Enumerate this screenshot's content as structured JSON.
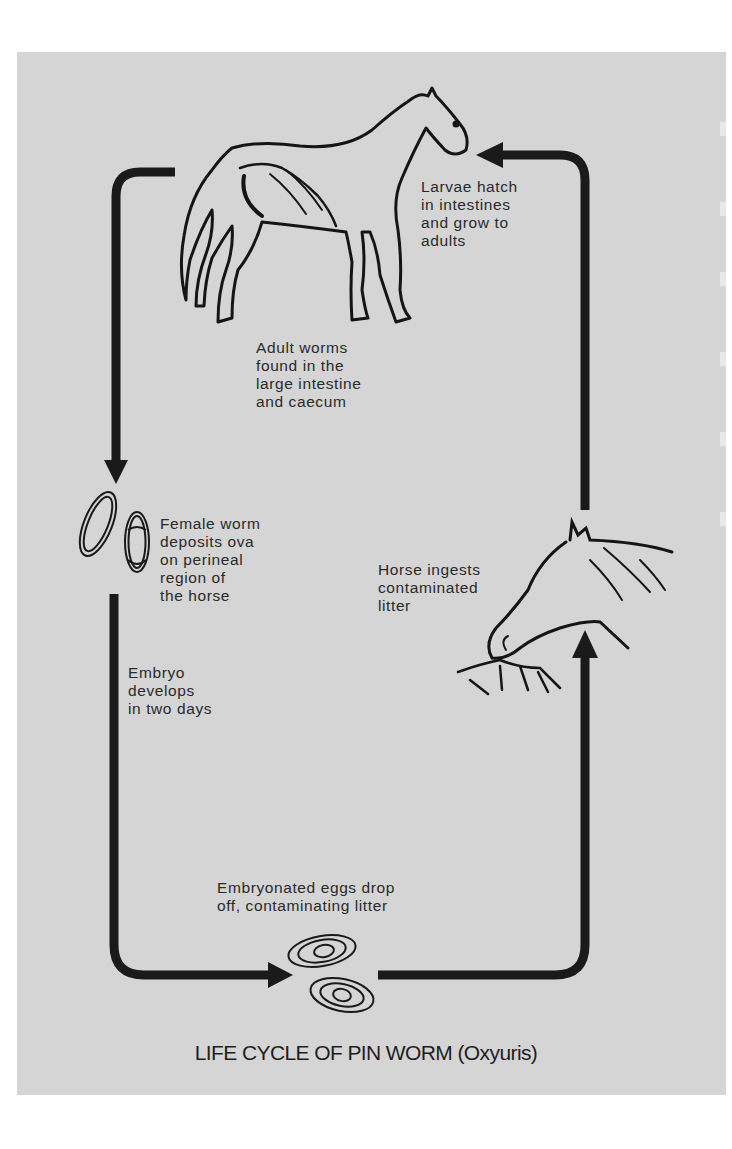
{
  "diagram": {
    "title": "LIFE CYCLE OF PIN WORM (Oxyuris)",
    "background_color": "#d5d5d5",
    "ink_color": "#1a1a1a",
    "stages": [
      {
        "id": "adult",
        "label": "Adult worms\nfound in the\nlarge intestine\nand caecum",
        "illustration": "standing-horse-with-intestines"
      },
      {
        "id": "ova",
        "label": "Female worm\ndeposits ova\non perineal\nregion of\nthe horse",
        "illustration": "two-oval-eggs"
      },
      {
        "id": "embryo",
        "label": "Embryo\ndevelops\nin two days"
      },
      {
        "id": "eggs",
        "label": "Embryonated eggs drop\noff, contaminating litter",
        "illustration": "two-spiral-eggs"
      },
      {
        "id": "ingest",
        "label": "Horse ingests\ncontaminated\nlitter",
        "illustration": "horse-head-eating-litter"
      },
      {
        "id": "hatch",
        "label": "Larvae hatch\nin intestines\nand grow to\nadults"
      }
    ],
    "flow": [
      "adult",
      "ova",
      "embryo",
      "eggs",
      "ingest",
      "hatch",
      "adult"
    ]
  }
}
